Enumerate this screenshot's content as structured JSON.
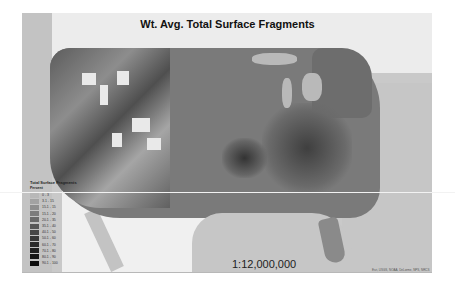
{
  "map": {
    "title": "Wt. Avg. Total Surface Fragments",
    "scale": "1:12,000,000",
    "credits": "Esri, USGS, NOAA, DeLorme, NPS, NRCS",
    "legend": {
      "title": "Total Surface Fragments",
      "subtitle": "Percent",
      "items": [
        {
          "label": "0 - 3",
          "color": "#b8b8b8"
        },
        {
          "label": "3.1 - 15",
          "color": "#a2a2a2"
        },
        {
          "label": "15.1 - 15",
          "color": "#8e8e8e"
        },
        {
          "label": "15.1 - 20",
          "color": "#7c7c7c"
        },
        {
          "label": "20.1 - 35",
          "color": "#6a6a6a"
        },
        {
          "label": "35.1 - 40",
          "color": "#585858"
        },
        {
          "label": "40.1 - 50",
          "color": "#474747"
        },
        {
          "label": "50.1 - 60",
          "color": "#383838"
        },
        {
          "label": "60.1 - 70",
          "color": "#2b2b2b"
        },
        {
          "label": "70.1 - 80",
          "color": "#202020"
        },
        {
          "label": "80.1 - 90",
          "color": "#161616"
        },
        {
          "label": "90.1 - 100",
          "color": "#0d0d0d"
        }
      ]
    }
  }
}
